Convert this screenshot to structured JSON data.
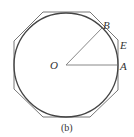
{
  "diagram": {
    "caption": "(b)",
    "labels": {
      "center": "O",
      "point_a": "A",
      "point_b": "B",
      "point_e": "E"
    },
    "shapes": {
      "circle": "inscribed circle",
      "polygon": "circumscribed regular octagon"
    },
    "colors": {
      "stroke": "#555555",
      "radius_stroke": "#888888",
      "text": "#333333"
    }
  }
}
